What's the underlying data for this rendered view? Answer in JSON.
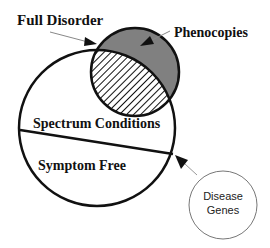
{
  "diagram": {
    "labels": {
      "full_disorder": "Full Disorder",
      "phenocopies": "Phenocopies",
      "spectrum_conditions": "Spectrum Conditions",
      "symptom_free": "Symptom Free",
      "disease_genes_line1": "Disease",
      "disease_genes_line2": "Genes"
    },
    "colors": {
      "outline": "#111111",
      "phenocopies_fill": "#808080",
      "hatch": "#111111",
      "thin_arrow": "#999999"
    }
  }
}
